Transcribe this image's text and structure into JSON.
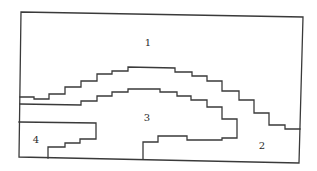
{
  "diagram": {
    "type": "region-partition",
    "regions": [
      {
        "id": "region-1",
        "label": "1"
      },
      {
        "id": "region-2",
        "label": "2"
      },
      {
        "id": "region-3",
        "label": "3"
      },
      {
        "id": "region-4",
        "label": "4"
      }
    ],
    "colors": {
      "line": "#3a3a3a",
      "label": "#2a2a2a",
      "background": "#ffffff"
    }
  }
}
